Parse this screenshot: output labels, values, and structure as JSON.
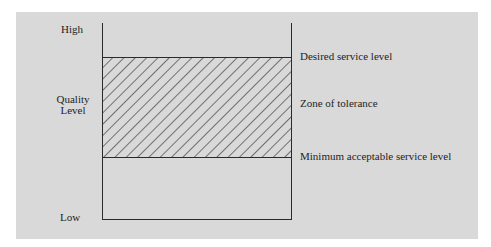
{
  "diagram": {
    "y_axis": {
      "top_label": "High",
      "title_line1": "Quality",
      "title_line2": "Level",
      "bottom_label": "Low"
    },
    "levels": {
      "desired": "Desired service level",
      "zone": "Zone of tolerance",
      "minimum": "Minimum acceptable service level"
    },
    "colors": {
      "panel": "#d9d9d9",
      "line": "#2a2a2a",
      "hatch": "#2a2a2a"
    }
  }
}
